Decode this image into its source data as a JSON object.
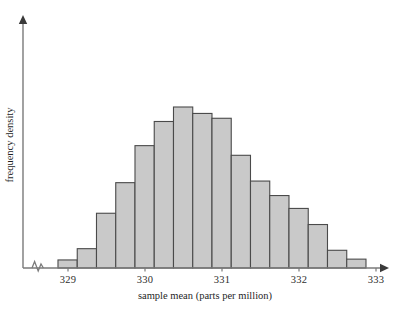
{
  "chart_data": {
    "type": "bar",
    "title": "",
    "subtitle": "",
    "xlabel": "sample mean (parts per million)",
    "ylabel": "frequency density",
    "grid": false,
    "legend": null,
    "legend_position": "none",
    "axis_break_x": true,
    "xlim": [
      328.87,
      333.6
    ],
    "ylim": [
      0,
      1.0
    ],
    "xtick_labels": [
      "329",
      "330",
      "331",
      "332",
      "333"
    ],
    "xtick_values": [
      329,
      330,
      331,
      332,
      333
    ],
    "ytick_labels": [],
    "bin_width": 0.25,
    "bin_edges": [
      328.87,
      329.12,
      329.37,
      329.62,
      329.87,
      330.12,
      330.37,
      330.62,
      330.87,
      331.12,
      331.37,
      331.62,
      331.87,
      332.12,
      332.37,
      332.62,
      332.87
    ],
    "bin_centers": [
      328.995,
      329.245,
      329.495,
      329.745,
      329.995,
      330.245,
      330.495,
      330.745,
      330.995,
      331.245,
      331.495,
      331.745,
      331.995,
      332.245,
      332.495,
      332.745
    ],
    "categories": [
      "328.87-329.12",
      "329.12-329.37",
      "329.37-329.62",
      "329.62-329.87",
      "329.87-330.12",
      "330.12-330.37",
      "330.37-330.62",
      "330.62-330.87",
      "330.87-331.12",
      "331.12-331.37",
      "331.37-331.62",
      "331.62-331.87",
      "331.87-332.12",
      "332.12-332.37",
      "332.37-332.62",
      "332.62-332.87"
    ],
    "values": [
      0.05,
      0.12,
      0.34,
      0.53,
      0.76,
      0.91,
      1.0,
      0.96,
      0.93,
      0.7,
      0.54,
      0.45,
      0.37,
      0.27,
      0.11,
      0.055
    ],
    "bar_heights_px": [
      8,
      19,
      55,
      85,
      122,
      147,
      161,
      155,
      150,
      113,
      87,
      72,
      60,
      44,
      17,
      9
    ],
    "annotations": []
  },
  "style": {
    "bar_fill": "#c9c9c9",
    "bar_stroke": "#4a4a4a",
    "axis_color": "#7a7a7a",
    "text_color": "#1f1f1f",
    "background": "#ffffff"
  },
  "icons": {
    "x_axis_arrow": "arrow-right-icon",
    "y_axis_arrow": "arrow-up-icon",
    "axis_break": "axis-break-zigzag-icon"
  }
}
